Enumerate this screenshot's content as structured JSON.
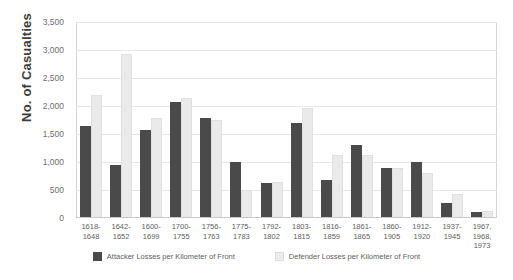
{
  "chart_data": {
    "type": "bar",
    "title": "",
    "xlabel": "",
    "ylabel": "No. of Casualties",
    "ylim": [
      0,
      3500
    ],
    "ytick_step": 500,
    "yticks": [
      "3,500",
      "3,000",
      "2,500",
      "2,000",
      "1,500",
      "1,000",
      "500",
      "0"
    ],
    "grid": "horizontal",
    "legend_position": "bottom-center",
    "categories": [
      "1618-\n1648",
      "1642-\n1652",
      "1600-\n1699",
      "1700-\n1755",
      "1756-\n1763",
      "1775-\n1783",
      "1792-\n1802",
      "1803-\n1815",
      "1816-\n1859",
      "1861-\n1865",
      "1860-\n1905",
      "1912-\n1920",
      "1937-\n1945",
      "1967,\n1968,\n1973"
    ],
    "series": [
      {
        "name": "Attacker Losses per Kilometer of Front",
        "color": "#4a4a4a",
        "values": [
          1650,
          950,
          1570,
          2080,
          1780,
          1000,
          620,
          1700,
          670,
          1300,
          900,
          1000,
          260,
          110
        ]
      },
      {
        "name": "Defender Losses per Kilometer of Front",
        "color": "#eaeaea",
        "values": [
          2200,
          2920,
          1780,
          2150,
          1750,
          500,
          650,
          1970,
          1130,
          1130,
          900,
          810,
          430,
          130
        ]
      }
    ]
  },
  "legend": {
    "attacker_label": "Attacker Losses per Kilometer of Front",
    "defender_label": "Defender Losses per Kilometer of Front"
  }
}
